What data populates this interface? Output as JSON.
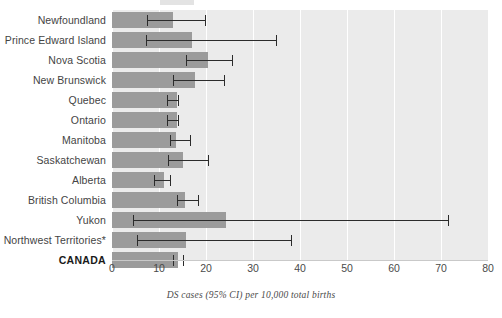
{
  "chart_data": {
    "type": "bar",
    "orientation": "horizontal",
    "title": "",
    "subtitle": "",
    "xlabel": "DS cases (95% CI) per 10,000 total births",
    "ylabel": "",
    "xlim": [
      0,
      80
    ],
    "xticks": [
      0,
      10,
      20,
      30,
      40,
      50,
      60,
      70,
      80
    ],
    "xtick_labels": [
      "0",
      "10",
      "20",
      "30",
      "40",
      "50",
      "60",
      "70",
      "80"
    ],
    "grid": true,
    "grid_axis": "x",
    "legend": false,
    "categories": [
      "Newfoundland",
      "Prince Edward Island",
      "Nova Scotia",
      "New Brunswick",
      "Quebec",
      "Ontario",
      "Manitoba",
      "Saskatchewan",
      "Alberta",
      "British Columbia",
      "Yukon",
      "Northwest Territories*",
      "CANADA"
    ],
    "values": [
      13.0,
      17.0,
      20.5,
      17.7,
      13.8,
      13.8,
      13.6,
      15.1,
      11.0,
      15.5,
      24.3,
      15.8,
      14.0
    ],
    "ci_low": [
      7.5,
      7.2,
      15.8,
      13.0,
      11.7,
      11.7,
      12.3,
      12.0,
      9.0,
      13.8,
      4.5,
      5.3,
      13.0
    ],
    "ci_high": [
      19.8,
      34.8,
      25.6,
      23.9,
      14.0,
      14.0,
      16.6,
      20.4,
      12.4,
      18.3,
      71.4,
      38.0,
      15.0
    ],
    "series": [
      {
        "name": "DS cases per 10,000 total births",
        "values": [
          13.0,
          17.0,
          20.5,
          17.7,
          13.8,
          13.8,
          13.6,
          15.1,
          11.0,
          15.5,
          24.3,
          15.8,
          14.0
        ]
      }
    ],
    "bold_categories": [
      "CANADA"
    ],
    "footnote_marker": "*",
    "colors": {
      "bar": "#9b9b9b",
      "error_bar": "#2b2b2b",
      "plot_background": "#ebebeb",
      "gridline": "#ffffff",
      "page_background": "#ffffff",
      "label_text": "#444444",
      "tick_text": "#4a4a4a",
      "caption_text": "#4a4a4a"
    }
  },
  "caption": {
    "text": "DS cases (95% CI) per 10,000 total births"
  }
}
